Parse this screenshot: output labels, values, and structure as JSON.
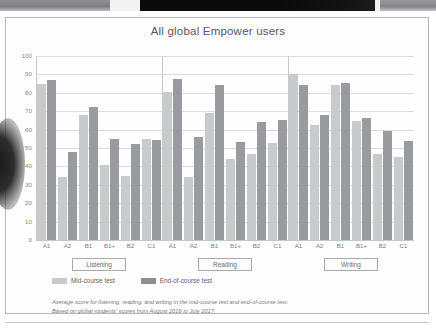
{
  "page": {
    "scan_artifacts": [
      "scan-bar-left",
      "scan-bar-center",
      "scan-bar-right"
    ],
    "curl_shadow": "page-curl-shadow"
  },
  "chart_data": {
    "type": "bar",
    "title": "All global Empower users",
    "xlabel": "",
    "ylabel": "",
    "ylim": [
      0,
      100
    ],
    "yticks": [
      0,
      10,
      20,
      30,
      40,
      50,
      60,
      70,
      80,
      90,
      100
    ],
    "grid": true,
    "legend_position": "bottom-left",
    "categories": [
      "A1",
      "A2",
      "B1",
      "B1+",
      "B2",
      "C1"
    ],
    "groups": [
      {
        "name": "Listening",
        "series": [
          {
            "name": "Mid-course test",
            "values": [
              85,
              34.5,
              68,
              41,
              35,
              55
            ]
          },
          {
            "name": "End-of-course test",
            "values": [
              87,
              48,
              72.5,
              55,
              52,
              54.5
            ]
          }
        ]
      },
      {
        "name": "Reading",
        "series": [
          {
            "name": "Mid-course test",
            "values": [
              80.5,
              34,
              69,
              44,
              46.5,
              52.5
            ]
          },
          {
            "name": "End-of-course test",
            "values": [
              87.5,
              56,
              84.5,
              53.5,
              64,
              65
            ]
          }
        ]
      },
      {
        "name": "Writing",
        "series": [
          {
            "name": "Mid-course test",
            "values": [
              90,
              62.5,
              84,
              64.5,
              46.5,
              45
            ]
          },
          {
            "name": "End-of-course test",
            "values": [
              84,
              68,
              85.5,
              66.5,
              59.5,
              54
            ]
          }
        ]
      }
    ],
    "series_colors": {
      "mid": "#c9cacc",
      "end": "#9a9b9f"
    },
    "annotations": [
      "Average score for listening, reading, and writing in the mid-course test and end-of-course test.",
      "Based on global students' scores from August 2016 to July 2017."
    ]
  },
  "legend": {
    "items": [
      {
        "label": "Mid-course test",
        "color": "#c9cacc"
      },
      {
        "label": "End-of-course test",
        "color": "#8e8f93"
      }
    ]
  },
  "footnote": {
    "line1": "Average score for listening, reading, and writing in the mid-course test and end-of-course test.",
    "line2": "Based on global students' scores from August 2016 to July 2017."
  }
}
